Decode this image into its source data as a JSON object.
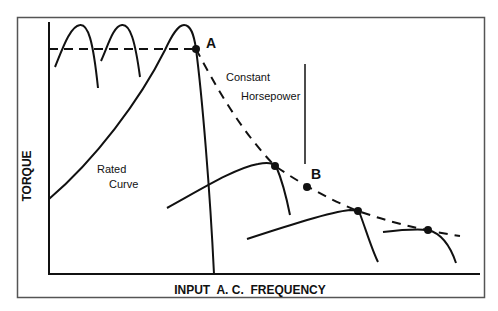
{
  "diagram": {
    "frame": {
      "x": 17,
      "y": 17,
      "width": 468,
      "height": 281,
      "stroke": "#555555"
    },
    "axes": {
      "origin": [
        49,
        274
      ],
      "y_top": 22,
      "x_right": 480,
      "x_label": "INPUT  A. C.  FREQUENCY",
      "y_label": "TORQUE"
    },
    "labels": {
      "point_a": "A",
      "point_b": "B",
      "constant": "Constant",
      "horsepower": "Horsepower",
      "rated": "Rated",
      "curve": "Curve"
    },
    "points": [
      {
        "name": "A",
        "x": 196,
        "y": 49
      },
      {
        "name": "p1",
        "x": 275,
        "y": 166
      },
      {
        "name": "B",
        "x": 307,
        "y": 187
      },
      {
        "name": "p3",
        "x": 358,
        "y": 211
      },
      {
        "name": "p4",
        "x": 428,
        "y": 230
      }
    ],
    "colors": {
      "line": "#111111",
      "background": "#ffffff"
    }
  }
}
